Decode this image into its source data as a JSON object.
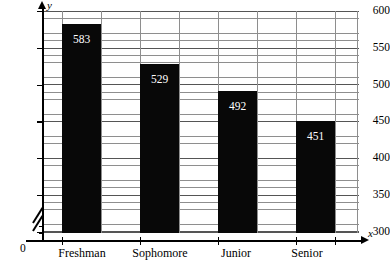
{
  "chart_data": {
    "type": "bar",
    "title": "",
    "xlabel": "x",
    "ylabel": "y",
    "categories": [
      "Freshman",
      "Sophomore",
      "Junior",
      "Senior"
    ],
    "values": [
      583,
      529,
      492,
      451
    ],
    "ylim": [
      300,
      600
    ],
    "y_ticks": [
      300,
      350,
      400,
      450,
      500,
      550,
      600
    ],
    "y_tick_labels": [
      "300",
      "350",
      "400",
      "450",
      "500",
      "550",
      "600"
    ],
    "y_minor_step": 10,
    "origin_label": "0",
    "axis_break": true,
    "grid": true,
    "legend": null,
    "bar_color": "#080808",
    "bar_label_color": "#ffffff",
    "gridline_color": "#8e8e8e",
    "axis_color": "#000000"
  },
  "axes": {
    "y_letter": "y",
    "x_letter": "x",
    "zero": "0"
  },
  "y_labels": [
    "600",
    "550",
    "500",
    "450",
    "400",
    "350",
    "300"
  ],
  "bars": [
    {
      "category": "Freshman",
      "value": 583,
      "label": "583"
    },
    {
      "category": "Sophomore",
      "value": 529,
      "label": "529"
    },
    {
      "category": "Junior",
      "value": 492,
      "label": "492"
    },
    {
      "category": "Senior",
      "value": 451,
      "label": "451"
    }
  ],
  "title_remnant": ""
}
